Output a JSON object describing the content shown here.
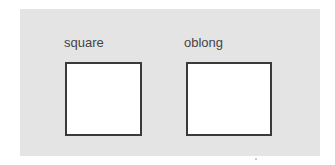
{
  "diagram": {
    "background_color": "#e4e4e4",
    "shapes": [
      {
        "label": "square",
        "type": "square"
      },
      {
        "label": "oblong",
        "type": "oblong"
      }
    ]
  }
}
